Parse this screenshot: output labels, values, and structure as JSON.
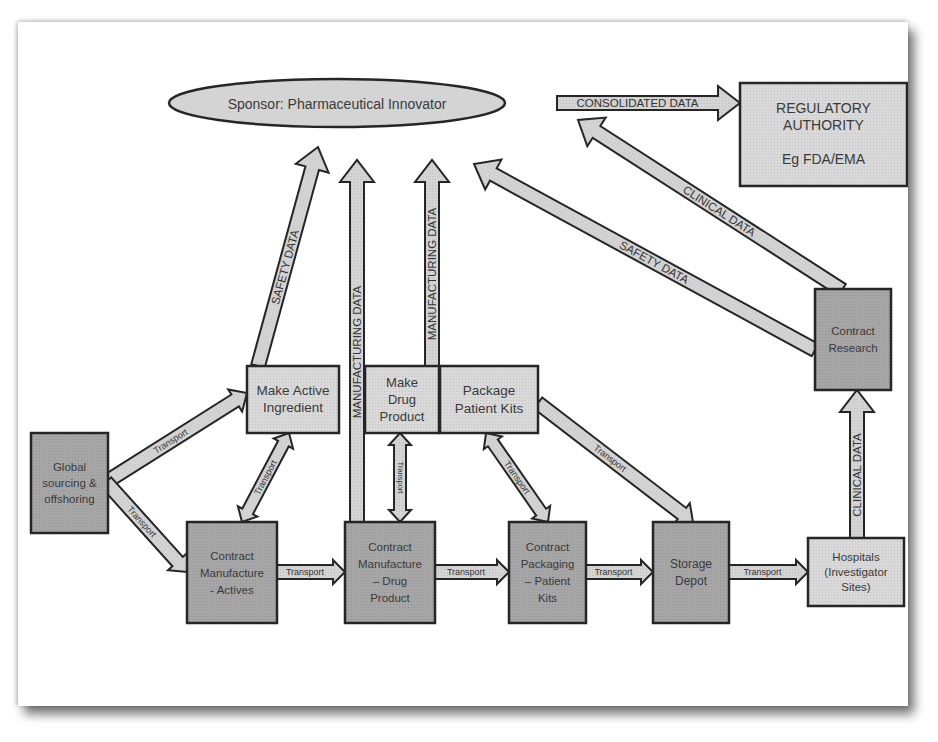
{
  "colors": {
    "light_fill": "#d9d9d9",
    "dark_fill": "#a6a6a6",
    "arrow_fill": "#d4d4d4",
    "stroke": "#262626",
    "text": "#3a3a3a"
  },
  "nodes": {
    "sponsor": [
      "Sponsor: Pharmaceutical Innovator"
    ],
    "regulatory": [
      "REGULATORY",
      "AUTHORITY",
      "",
      "Eg FDA/EMA"
    ],
    "make_active": [
      "Make Active",
      "Ingredient"
    ],
    "make_drug": [
      "Make",
      "Drug",
      "Product"
    ],
    "package_kits": [
      "Package",
      "Patient Kits"
    ],
    "global_sourcing": [
      "Global",
      "sourcing &",
      "offshoring"
    ],
    "cm_actives": [
      "Contract",
      "Manufacture",
      "- Actives"
    ],
    "cm_drug": [
      "Contract",
      "Manufacture",
      "– Drug",
      "Product"
    ],
    "cp_kits": [
      "Contract",
      "Packaging",
      "– Patient",
      "Kits"
    ],
    "storage": [
      "Storage",
      "Depot"
    ],
    "hospitals": [
      "Hospitals",
      "(Investigator",
      "Sites)"
    ],
    "contract_research": [
      "Contract",
      "Research"
    ]
  },
  "arrows": {
    "consolidated": "CONSOLIDATED DATA",
    "clinical_to_sponsor": "CLINICAL DATA",
    "safety_cr_to_sponsor": "SAFETY DATA",
    "safety_active_to_sponsor": "SAFETY DATA",
    "mfg_cm_drug": "MANUFACTURING DATA",
    "mfg_make_drug": "MANUFACTURING DATA",
    "clinical_hosp_to_cr": "CLINICAL DATA",
    "transport": "Transport"
  }
}
